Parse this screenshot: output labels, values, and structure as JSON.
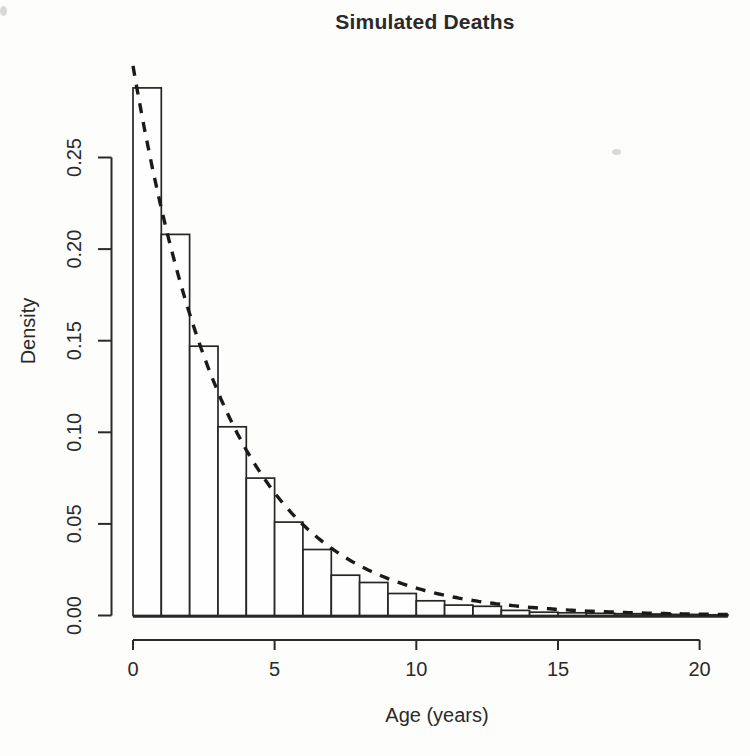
{
  "chart_data": {
    "type": "bar",
    "subtype": "histogram",
    "title": "Simulated Deaths",
    "xlabel": "Age (years)",
    "ylabel": "Density",
    "grid": false,
    "legend": null,
    "xlim": [
      0,
      21
    ],
    "ylim": [
      0,
      0.3
    ],
    "x_ticks": [
      0,
      5,
      10,
      15,
      20
    ],
    "y_ticks": [
      "0.00",
      "0.05",
      "0.10",
      "0.15",
      "0.20",
      "0.25"
    ],
    "bin_edges": [
      0,
      1,
      2,
      3,
      4,
      5,
      6,
      7,
      8,
      9,
      10,
      11,
      12,
      13,
      14,
      15,
      16,
      17,
      18,
      19,
      20,
      21
    ],
    "densities": [
      0.288,
      0.208,
      0.147,
      0.103,
      0.075,
      0.051,
      0.036,
      0.022,
      0.018,
      0.012,
      0.008,
      0.0057,
      0.005,
      0.0028,
      0.0018,
      0.0015,
      0.0012,
      0.001,
      0.0008,
      0.0006,
      0.0004
    ],
    "overlay_curve": {
      "name": "exponential-density-curve",
      "distribution": "exponential",
      "rate": 0.3,
      "line_style": "dashed",
      "x_range": [
        0,
        21
      ]
    },
    "colors": {
      "bar_fill": "#fefefe",
      "bar_stroke": "#262626",
      "curve_stroke": "#1a1a1a",
      "axis": "#2a2a2a",
      "background": "#fdfdfc"
    }
  },
  "scan_artifacts": [
    {
      "x": 612,
      "y": 149,
      "w": 9,
      "h": 6
    },
    {
      "x": 0,
      "y": 6,
      "w": 7,
      "h": 10
    }
  ]
}
